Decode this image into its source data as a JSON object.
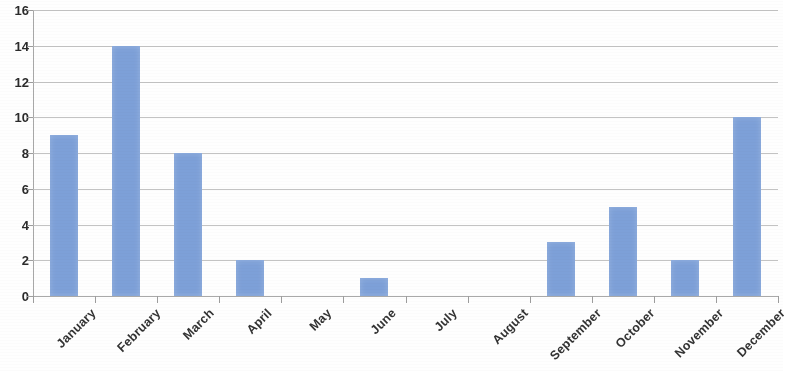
{
  "chart_data": {
    "type": "bar",
    "title": "",
    "subtitle": "",
    "xlabel": "",
    "ylabel": "",
    "categories": [
      "January",
      "February",
      "March",
      "April",
      "May",
      "June",
      "July",
      "August",
      "September",
      "October",
      "November",
      "December"
    ],
    "values": [
      9,
      14,
      8,
      2,
      0,
      1,
      0,
      0,
      3,
      5,
      2,
      10
    ],
    "ylim": [
      0,
      16
    ],
    "ytick_step": 2,
    "ytick_labels": [
      "16",
      "14",
      "12",
      "10",
      "8",
      "6",
      "4",
      "2",
      "0"
    ],
    "ytick_values": [
      16,
      14,
      12,
      10,
      8,
      6,
      4,
      2,
      0
    ],
    "grid": true,
    "grid_axis": "y",
    "legend": false,
    "legend_position": "none",
    "series": [
      {
        "name": "",
        "values": [
          9,
          14,
          8,
          2,
          0,
          1,
          0,
          0,
          3,
          5,
          2,
          10
        ]
      }
    ],
    "colors": {
      "bar": "#7da0d8",
      "gridline": "#b9b9b9",
      "axis": "#a8a8a8",
      "tick_label": "#2b2b2b",
      "category_label": "#333333",
      "background": "#ffffff"
    },
    "label_rotation_deg": -45
  }
}
